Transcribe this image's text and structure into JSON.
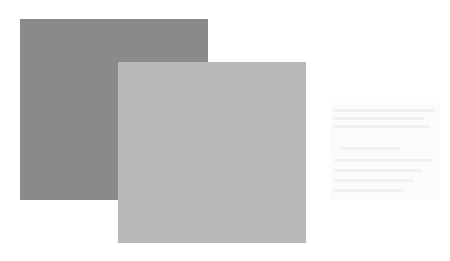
{
  "shapes": [
    {
      "name": "dark-square",
      "color": "#8a8a8a"
    },
    {
      "name": "light-square",
      "color": "#b8b8b8"
    }
  ],
  "faint_box": {
    "color": "#fbfbfb",
    "text": ""
  }
}
